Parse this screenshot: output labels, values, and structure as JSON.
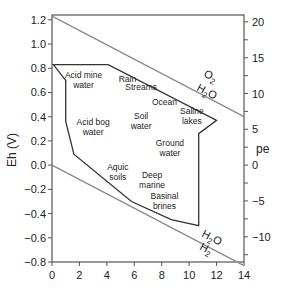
{
  "chart_data": {
    "type": "line",
    "title": "",
    "xlabel": "",
    "ylabel": "Eh (V)",
    "ylabel_right": "pe",
    "xlim": [
      0,
      14
    ],
    "ylim": [
      -0.8,
      1.2
    ],
    "x_ticks": [
      "0",
      "2",
      "4",
      "6",
      "8",
      "10",
      "12",
      "14"
    ],
    "y_ticks": [
      "1.2",
      "1.0",
      "0.8",
      "0.6",
      "0.4",
      "0.2",
      "0.0",
      "−0.2",
      "−0.4",
      "−0.6",
      "−0.8"
    ],
    "y_ticks_right": [
      "20",
      "15",
      "10",
      "5",
      "0",
      "−5",
      "−10"
    ],
    "grid": false,
    "series": [
      {
        "name": "O2 / H2O boundary",
        "x": [
          0,
          14
        ],
        "y": [
          1.23,
          0.4
        ]
      },
      {
        "name": "H2O / H2 boundary",
        "x": [
          0,
          14
        ],
        "y": [
          0.0,
          -0.83
        ]
      },
      {
        "name": "Natural environments envelope",
        "closed": true,
        "x": [
          0.1,
          1.0,
          1.0,
          1.6,
          5.8,
          8.7,
          10.7,
          10.7,
          12.0,
          4.1
        ],
        "y": [
          0.83,
          0.7,
          0.36,
          0.09,
          -0.3,
          -0.45,
          -0.5,
          0.26,
          0.37,
          0.83
        ]
      }
    ],
    "annotations": [
      {
        "text": "O2",
        "x": 11.2,
        "y": 0.79
      },
      {
        "text": "H2O",
        "x": 11.0,
        "y": 0.64
      },
      {
        "text": "H2O",
        "x": 11.8,
        "y": -0.62
      },
      {
        "text": "H2",
        "x": 11.5,
        "y": -0.73
      }
    ],
    "environment_labels": [
      {
        "text": [
          "Acid mine",
          "water"
        ],
        "x": 2.3,
        "y": 0.72
      },
      {
        "text": [
          "Rain"
        ],
        "x": 5.5,
        "y": 0.69
      },
      {
        "text": [
          "Streams"
        ],
        "x": 6.5,
        "y": 0.62
      },
      {
        "text": [
          "Ocean"
        ],
        "x": 8.2,
        "y": 0.5
      },
      {
        "text": [
          "Saline",
          "lakes"
        ],
        "x": 10.2,
        "y": 0.42
      },
      {
        "text": [
          "Soil",
          "water"
        ],
        "x": 6.5,
        "y": 0.38
      },
      {
        "text": [
          "Acid bog",
          "water"
        ],
        "x": 3.0,
        "y": 0.33
      },
      {
        "text": [
          "Ground",
          "water"
        ],
        "x": 8.6,
        "y": 0.16
      },
      {
        "text": [
          "Aquic",
          "soils"
        ],
        "x": 4.8,
        "y": -0.04
      },
      {
        "text": [
          "Deep",
          "marine"
        ],
        "x": 7.3,
        "y": -0.11
      },
      {
        "text": [
          "Basinal",
          "brines"
        ],
        "x": 8.2,
        "y": -0.28
      }
    ]
  },
  "labels": {
    "ylabel": "Eh (V)",
    "ylabel_right": "pe",
    "o2": "O",
    "o2_sub": "2",
    "h2o_upper_h": "H",
    "h2o_upper_sub": "2",
    "h2o_upper_o": "O",
    "h2o_lower_h": "H",
    "h2o_lower_sub": "2",
    "h2o_lower_o": "O",
    "h2": "H",
    "h2_sub": "2"
  }
}
